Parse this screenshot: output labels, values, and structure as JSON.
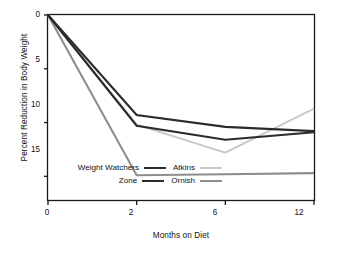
{
  "chart_data": {
    "type": "line",
    "title": "",
    "xlabel": "Months on Diet",
    "ylabel": "Percent Reduction in Body Weight",
    "x": [
      0,
      2,
      6,
      12
    ],
    "xtick_labels": [
      "0",
      "2",
      "6",
      "12"
    ],
    "ytick_labels": [
      "0",
      "5",
      "10",
      "15"
    ],
    "yticks": [
      0,
      5,
      10,
      15
    ],
    "ylim": [
      0,
      17.2
    ],
    "y_inverted": true,
    "x_scale": "ordinal",
    "grid": false,
    "legend_position": "inside-bottom-left",
    "series": [
      {
        "name": "Weight Watchers",
        "color": "#2b2b2b",
        "width": 2.1,
        "values": [
          0,
          9.3,
          10.4,
          10.8
        ]
      },
      {
        "name": "Atkins",
        "color": "#c9c9c9",
        "width": 2.1,
        "values": [
          0,
          10.2,
          12.8,
          8.7
        ]
      },
      {
        "name": "Zone",
        "color": "#2b2b2b",
        "width": 2.1,
        "values": [
          0,
          10.3,
          11.6,
          10.9
        ]
      },
      {
        "name": "Ornish",
        "color": "#8d8d8d",
        "width": 2.1,
        "values": [
          0,
          14.9,
          14.8,
          14.7
        ]
      }
    ]
  },
  "legend": {
    "rows": [
      {
        "left": {
          "label": "Weight Watchers",
          "color": "#2b2b2b"
        },
        "right": {
          "label": "Atkins",
          "color": "#c9c9c9"
        }
      },
      {
        "left": {
          "label": "Zone",
          "color": "#2b2b2b"
        },
        "right": {
          "label": "Ornish",
          "color": "#8d8d8d"
        }
      }
    ]
  },
  "axes": {
    "frame_color": "#1a1a1a",
    "tick_color": "#1a1a1a"
  }
}
